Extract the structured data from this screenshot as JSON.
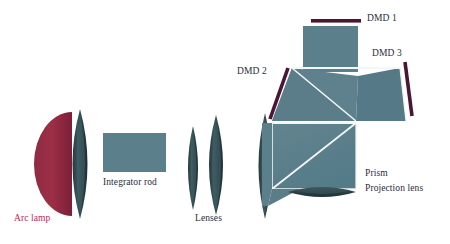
{
  "figure": {
    "background_color": "#ffffff"
  },
  "colors": {
    "glass_teal": "#5c7f8c",
    "glass_teal_dark": "#4f7582",
    "lens_dark": "#2e4449",
    "reflector_crimson": "#93283f",
    "dmd_purple": "#4b1533",
    "edge_white": "#f4f7f7",
    "label_text": "#2b2b3a",
    "label_accent": "#b6295c"
  },
  "labels": {
    "arc_lamp": "Arc lamp",
    "integrator_rod": "Integrator rod",
    "lenses": "Lenses",
    "dmd_1": "DMD 1",
    "dmd_2": "DMD 2",
    "dmd_3": "DMD 3",
    "prism": "Prism",
    "projection_lens": "Projection lens"
  },
  "components": [
    {
      "name": "arc-lamp-reflector",
      "label": "Arc lamp",
      "shape": "half-ellipse",
      "color": "#93283f"
    },
    {
      "name": "condenser-lens-1",
      "label": "Lens",
      "shape": "biconvex",
      "color": "#2e4449"
    },
    {
      "name": "integrator-rod",
      "label": "Integrator rod",
      "shape": "rectangle",
      "color": "#5c7f8c"
    },
    {
      "name": "relay-lens-1",
      "label": "Lens",
      "shape": "biconvex",
      "color": "#2e4449"
    },
    {
      "name": "relay-lens-2",
      "label": "Lens",
      "shape": "biconvex",
      "color": "#2e4449"
    },
    {
      "name": "relay-lens-3",
      "label": "Lens",
      "shape": "biconvex",
      "color": "#2e4449"
    },
    {
      "name": "prism-assembly",
      "label": "Prism",
      "shape": "tir-prism",
      "color": "#5c7f8c"
    },
    {
      "name": "dmd-1-panel",
      "label": "DMD 1",
      "shape": "bar",
      "color": "#4b1533"
    },
    {
      "name": "dmd-2-panel",
      "label": "DMD 2",
      "shape": "bar",
      "color": "#4b1533"
    },
    {
      "name": "dmd-3-panel",
      "label": "DMD 3",
      "shape": "bar",
      "color": "#4b1533"
    },
    {
      "name": "projection-lens",
      "label": "Projection lens",
      "shape": "flat-biconvex",
      "color": "#2e4449"
    }
  ]
}
